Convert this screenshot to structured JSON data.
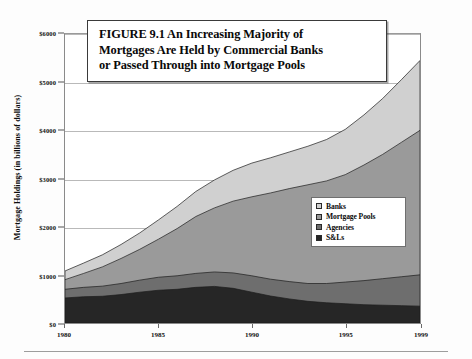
{
  "figure": {
    "title_lines": [
      "FIGURE 9.1  An Increasing Majority of",
      "Mortgages Are Held by Commercial Banks",
      "or Passed Through into Mortgage Pools"
    ]
  },
  "legend": {
    "items": [
      {
        "label": "Banks",
        "color": "#d0d0d0"
      },
      {
        "label": "Mortgage Pools",
        "color": "#9a9a9a"
      },
      {
        "label": "Agencies",
        "color": "#6e6e6e"
      },
      {
        "label": "S&Ls",
        "color": "#262626"
      }
    ]
  },
  "chart_data": {
    "type": "area",
    "stacked": true,
    "title": "FIGURE 9.1  An Increasing Majority of Mortgages Are Held by Commercial Banks or Passed Through into Mortgage Pools",
    "xlabel": "",
    "ylabel": "Mortgage Holdings (in billions of dollars)",
    "xlim": [
      1980,
      1999
    ],
    "ylim": [
      0,
      6000
    ],
    "grid": true,
    "legend_position": "center-right",
    "x": [
      1980,
      1981,
      1982,
      1983,
      1984,
      1985,
      1986,
      1987,
      1988,
      1989,
      1990,
      1991,
      1992,
      1993,
      1994,
      1995,
      1996,
      1997,
      1998,
      1999
    ],
    "x_tick_labels": [
      "1980",
      "1985",
      "1990",
      "1995",
      "1999"
    ],
    "x_ticks": [
      1980,
      1985,
      1990,
      1995,
      1999
    ],
    "y_ticks": [
      0,
      1000,
      2000,
      3000,
      4000,
      5000,
      6000
    ],
    "y_tick_labels": [
      "$0",
      "$1000",
      "$2000",
      "$3000",
      "$4000",
      "$5000",
      "$6000"
    ],
    "series": [
      {
        "name": "S&Ls",
        "color": "#262626",
        "values": [
          520,
          545,
          555,
          590,
          640,
          680,
          700,
          740,
          760,
          720,
          640,
          560,
          500,
          450,
          420,
          400,
          380,
          370,
          360,
          350
        ]
      },
      {
        "name": "Agencies",
        "color": "#6e6e6e",
        "values": [
          180,
          195,
          210,
          230,
          250,
          270,
          280,
          290,
          300,
          320,
          340,
          350,
          360,
          370,
          400,
          450,
          500,
          550,
          600,
          650
        ]
      },
      {
        "name": "Mortgage Pools",
        "color": "#9a9a9a",
        "values": [
          200,
          290,
          400,
          520,
          640,
          790,
          980,
          1180,
          1330,
          1490,
          1640,
          1790,
          1930,
          2050,
          2130,
          2230,
          2400,
          2580,
          2790,
          3000
        ]
      },
      {
        "name": "Banks",
        "color": "#d0d0d0",
        "values": [
          180,
          215,
          250,
          290,
          340,
          400,
          460,
          520,
          580,
          640,
          700,
          730,
          760,
          800,
          860,
          940,
          1040,
          1160,
          1300,
          1450
        ]
      }
    ],
    "totals": [
      1080,
      1245,
      1415,
      1630,
      1870,
      2140,
      2420,
      2730,
      2970,
      3170,
      3320,
      3430,
      3550,
      3670,
      3810,
      4020,
      4320,
      4660,
      5050,
      5450
    ]
  }
}
